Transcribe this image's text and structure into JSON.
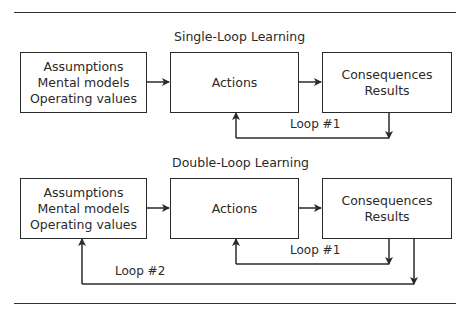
{
  "diagram": {
    "single_loop": {
      "title": "Single-Loop Learning",
      "boxes": [
        {
          "lines": [
            "Assumptions",
            "Mental models",
            "Operating values"
          ]
        },
        {
          "lines": [
            "Actions"
          ]
        },
        {
          "lines": [
            "Consequences",
            "Results"
          ]
        }
      ],
      "loops": [
        {
          "label": "Loop #1",
          "from": "Consequences / Results",
          "to": "Actions"
        }
      ]
    },
    "double_loop": {
      "title": "Double-Loop Learning",
      "boxes": [
        {
          "lines": [
            "Assumptions",
            "Mental models",
            "Operating values"
          ]
        },
        {
          "lines": [
            "Actions"
          ]
        },
        {
          "lines": [
            "Consequences",
            "Results"
          ]
        }
      ],
      "loops": [
        {
          "label": "Loop #1",
          "from": "Consequences / Results",
          "to": "Actions"
        },
        {
          "label": "Loop #2",
          "from": "Consequences / Results",
          "to": "Assumptions / Mental models / Operating values"
        }
      ]
    }
  },
  "colors": {
    "line": "#2a2a2a",
    "background": "#ffffff"
  }
}
